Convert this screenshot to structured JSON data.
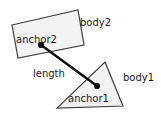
{
  "diagram": {
    "canvas": {
      "width": 161,
      "height": 115,
      "background": "#ffffff"
    },
    "style": {
      "shape_fill": "#f2f2f2",
      "shape_stroke": "#404040",
      "line_color": "#0d0d0d",
      "text_color": "#1a1a1a",
      "font_size_px": 10
    },
    "shapes": [
      {
        "id": "body2-shape",
        "kind": "quadrilateral",
        "label": "body2",
        "points": "12,25 78,10 84,45 18,58"
      },
      {
        "id": "body1-shape",
        "kind": "triangle",
        "label": "body1",
        "points": "105,62 123,106 57,108"
      }
    ],
    "connector": {
      "id": "length-link",
      "label": "length",
      "from": {
        "name": "anchor2",
        "x": 41,
        "y": 45
      },
      "to": {
        "name": "anchor1",
        "x": 97,
        "y": 86
      },
      "dot_radius": 3.1
    },
    "labels": [
      {
        "id": "anchor2-label",
        "text": "anchor2",
        "x": 16,
        "y": 43,
        "anchor": "start"
      },
      {
        "id": "body2-label",
        "text": "body2",
        "x": 80,
        "y": 26,
        "anchor": "start"
      },
      {
        "id": "length-label",
        "text": "length",
        "x": 33,
        "y": 77,
        "anchor": "start"
      },
      {
        "id": "anchor1-label",
        "text": "anchor1",
        "x": 68,
        "y": 102,
        "anchor": "start"
      },
      {
        "id": "body1-label",
        "text": "body1",
        "x": 123,
        "y": 81,
        "anchor": "start"
      }
    ]
  }
}
